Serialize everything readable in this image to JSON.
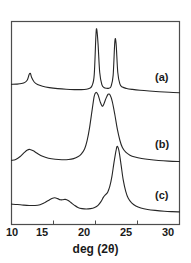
{
  "chart_data": {
    "type": "line",
    "title": "",
    "subtitle": "",
    "xlabel": "deg (2θ)",
    "ylabel": "",
    "xlim": [
      10,
      30
    ],
    "ylim": [
      0,
      1
    ],
    "xticks": [
      10,
      15,
      20,
      25,
      30
    ],
    "xticklabels": [
      "10",
      "15",
      "20",
      "25",
      "30"
    ],
    "yticks": [],
    "yticklabels": [],
    "grid": false,
    "legend": "none",
    "axis_note": "Intensity (arbitrary units), vertically offset stacked traces; y-axis unlabeled and untricked",
    "annotations": [
      {
        "text": "(a)",
        "x": 25.9,
        "y_frac": 0.78,
        "trace": "a"
      },
      {
        "text": "(b)",
        "x": 25.9,
        "y_frac": 0.45,
        "trace": "b"
      },
      {
        "text": "(c)",
        "x": 25.9,
        "y_frac": 0.18,
        "trace": "c"
      }
    ],
    "series": [
      {
        "name": "(a)",
        "label": "(a)",
        "color": "#262626",
        "description": "Crystalline pattern: sharp reflection near 12.2 deg, two sharp intense reflections near 20.1 and 22.3 deg",
        "peaks": [
          {
            "x": 12.2,
            "height": 0.3,
            "width": 0.35,
            "type": "sharp"
          },
          {
            "x": 20.1,
            "height": 0.88,
            "width": 0.3,
            "type": "sharp"
          },
          {
            "x": 22.3,
            "height": 0.72,
            "width": 0.28,
            "type": "sharp"
          }
        ],
        "points": [
          [
            10.0,
            0.175
          ],
          [
            10.6,
            0.178
          ],
          [
            11.2,
            0.185
          ],
          [
            11.6,
            0.2
          ],
          [
            11.9,
            0.235
          ],
          [
            12.1,
            0.3
          ],
          [
            12.25,
            0.315
          ],
          [
            12.4,
            0.262
          ],
          [
            12.7,
            0.205
          ],
          [
            13.1,
            0.172
          ],
          [
            13.7,
            0.15
          ],
          [
            14.5,
            0.133
          ],
          [
            15.5,
            0.12
          ],
          [
            16.5,
            0.112
          ],
          [
            17.5,
            0.108
          ],
          [
            18.3,
            0.108
          ],
          [
            18.9,
            0.112
          ],
          [
            19.3,
            0.124
          ],
          [
            19.6,
            0.16
          ],
          [
            19.85,
            0.3
          ],
          [
            20.05,
            0.8
          ],
          [
            20.15,
            0.88
          ],
          [
            20.3,
            0.7
          ],
          [
            20.5,
            0.33
          ],
          [
            20.75,
            0.175
          ],
          [
            21.0,
            0.135
          ],
          [
            21.3,
            0.124
          ],
          [
            21.6,
            0.126
          ],
          [
            21.85,
            0.15
          ],
          [
            22.1,
            0.29
          ],
          [
            22.3,
            0.72
          ],
          [
            22.45,
            0.7
          ],
          [
            22.65,
            0.33
          ],
          [
            22.9,
            0.18
          ],
          [
            23.2,
            0.14
          ],
          [
            23.7,
            0.122
          ],
          [
            24.4,
            0.11
          ],
          [
            25.3,
            0.099
          ],
          [
            26.4,
            0.089
          ],
          [
            27.6,
            0.08
          ],
          [
            28.8,
            0.073
          ],
          [
            30.0,
            0.068
          ]
        ]
      },
      {
        "name": "(b)",
        "label": "(b)",
        "color": "#262626",
        "description": "Semi-crystalline pattern: weak broad bump near 12 deg, large broad double-humped halo near 20.0 and 21.6 deg",
        "peaks": [
          {
            "x": 12.0,
            "height": 0.18,
            "width": 1.0,
            "type": "broad"
          },
          {
            "x": 20.0,
            "height": 0.8,
            "width": 1.1,
            "type": "broad"
          },
          {
            "x": 21.6,
            "height": 0.78,
            "width": 1.1,
            "type": "broad"
          }
        ],
        "points": [
          [
            10.0,
            0.06
          ],
          [
            10.5,
            0.072
          ],
          [
            11.0,
            0.1
          ],
          [
            11.5,
            0.145
          ],
          [
            11.9,
            0.175
          ],
          [
            12.2,
            0.18
          ],
          [
            12.6,
            0.165
          ],
          [
            13.1,
            0.135
          ],
          [
            13.7,
            0.105
          ],
          [
            14.4,
            0.085
          ],
          [
            15.2,
            0.073
          ],
          [
            16.0,
            0.068
          ],
          [
            16.8,
            0.07
          ],
          [
            17.4,
            0.08
          ],
          [
            17.9,
            0.1
          ],
          [
            18.3,
            0.13
          ],
          [
            18.7,
            0.185
          ],
          [
            19.0,
            0.275
          ],
          [
            19.3,
            0.42
          ],
          [
            19.6,
            0.61
          ],
          [
            19.85,
            0.76
          ],
          [
            20.05,
            0.8
          ],
          [
            20.3,
            0.775
          ],
          [
            20.55,
            0.7
          ],
          [
            20.8,
            0.65
          ],
          [
            21.0,
            0.675
          ],
          [
            21.25,
            0.735
          ],
          [
            21.5,
            0.78
          ],
          [
            21.75,
            0.77
          ],
          [
            22.0,
            0.7
          ],
          [
            22.3,
            0.56
          ],
          [
            22.6,
            0.4
          ],
          [
            22.9,
            0.28
          ],
          [
            23.2,
            0.2
          ],
          [
            23.6,
            0.15
          ],
          [
            24.1,
            0.118
          ],
          [
            24.7,
            0.098
          ],
          [
            25.5,
            0.082
          ],
          [
            26.4,
            0.07
          ],
          [
            27.5,
            0.06
          ],
          [
            28.7,
            0.053
          ],
          [
            30.0,
            0.048
          ]
        ]
      },
      {
        "name": "(c)",
        "label": "(c)",
        "color": "#262626",
        "description": "Amorphous-like pattern: broad low bump with structure near 15-16.5 deg, dominant broad peak near 22.6 deg with low-angle shoulder near 21 deg",
        "peaks": [
          {
            "x": 15.2,
            "height": 0.22,
            "width": 1.0,
            "type": "broad"
          },
          {
            "x": 16.4,
            "height": 0.2,
            "width": 0.9,
            "type": "broad"
          },
          {
            "x": 21.0,
            "height": 0.3,
            "width": 1.2,
            "type": "shoulder"
          },
          {
            "x": 22.6,
            "height": 0.85,
            "width": 0.9,
            "type": "broad"
          }
        ],
        "points": [
          [
            10.0,
            0.145
          ],
          [
            10.7,
            0.14
          ],
          [
            11.4,
            0.133
          ],
          [
            12.1,
            0.128
          ],
          [
            12.8,
            0.128
          ],
          [
            13.4,
            0.138
          ],
          [
            13.9,
            0.16
          ],
          [
            14.4,
            0.19
          ],
          [
            14.8,
            0.213
          ],
          [
            15.15,
            0.222
          ],
          [
            15.5,
            0.212
          ],
          [
            15.8,
            0.198
          ],
          [
            16.1,
            0.198
          ],
          [
            16.4,
            0.203
          ],
          [
            16.75,
            0.19
          ],
          [
            17.1,
            0.162
          ],
          [
            17.5,
            0.13
          ],
          [
            17.9,
            0.105
          ],
          [
            18.4,
            0.09
          ],
          [
            18.9,
            0.085
          ],
          [
            19.4,
            0.09
          ],
          [
            19.9,
            0.105
          ],
          [
            20.3,
            0.13
          ],
          [
            20.65,
            0.175
          ],
          [
            20.95,
            0.23
          ],
          [
            21.2,
            0.26
          ],
          [
            21.45,
            0.29
          ],
          [
            21.7,
            0.36
          ],
          [
            21.95,
            0.48
          ],
          [
            22.2,
            0.65
          ],
          [
            22.45,
            0.8
          ],
          [
            22.6,
            0.85
          ],
          [
            22.8,
            0.79
          ],
          [
            23.05,
            0.62
          ],
          [
            23.3,
            0.44
          ],
          [
            23.6,
            0.3
          ],
          [
            23.9,
            0.215
          ],
          [
            24.3,
            0.16
          ],
          [
            24.8,
            0.122
          ],
          [
            25.4,
            0.098
          ],
          [
            26.2,
            0.08
          ],
          [
            27.1,
            0.068
          ],
          [
            28.2,
            0.058
          ],
          [
            29.1,
            0.053
          ],
          [
            30.0,
            0.05
          ]
        ]
      }
    ]
  },
  "axis": {
    "xlabel": "deg (2θ)",
    "tick_labels": [
      "10",
      "15",
      "20",
      "25",
      "30"
    ]
  },
  "curve_labels": {
    "a": "(a)",
    "b": "(b)",
    "c": "(c)"
  },
  "colors": {
    "line": "#262626",
    "frame": "#4d4d4d",
    "text": "#1a1a1a",
    "background": "#ffffff"
  }
}
